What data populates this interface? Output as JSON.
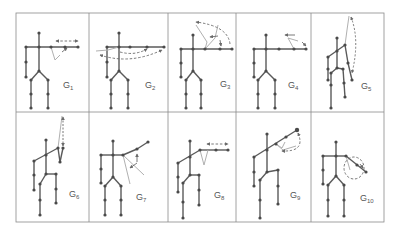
{
  "figure": {
    "grid": {
      "rows": 2,
      "cols": 5,
      "border_color": "#8a8a8a",
      "background": "#ffffff"
    },
    "colors": {
      "skeleton": "#5a5a5a",
      "joint": "#4a4a4a",
      "motion_arrow": "#6a6a6a",
      "ghost_limb": "#b0b0b0"
    },
    "panels": [
      {
        "id": "G1",
        "letter": "G",
        "sub": "1"
      },
      {
        "id": "G2",
        "letter": "G",
        "sub": "2"
      },
      {
        "id": "G3",
        "letter": "G",
        "sub": "3"
      },
      {
        "id": "G4",
        "letter": "G",
        "sub": "4"
      },
      {
        "id": "G5",
        "letter": "G",
        "sub": "5"
      },
      {
        "id": "G6",
        "letter": "G",
        "sub": "6"
      },
      {
        "id": "G7",
        "letter": "G",
        "sub": "7"
      },
      {
        "id": "G8",
        "letter": "G",
        "sub": "8"
      },
      {
        "id": "G9",
        "letter": "G",
        "sub": "9"
      },
      {
        "id": "G10",
        "letter": "G",
        "sub": "10"
      }
    ]
  }
}
